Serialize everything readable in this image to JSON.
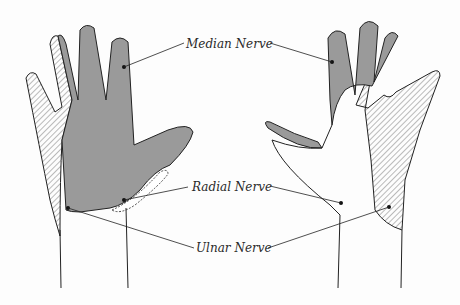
{
  "diagram": {
    "colors": {
      "median": "#9a9a9a",
      "radial": "#ffffff",
      "ulnar_hatch": "#555555",
      "outline": "#222222",
      "background": "#fdfdfd"
    },
    "labels": [
      {
        "id": "median",
        "text": "Median Nerve"
      },
      {
        "id": "radial",
        "text": "Radial Nerve"
      },
      {
        "id": "ulnar",
        "text": "Ulnar Nerve"
      }
    ],
    "hands": [
      {
        "id": "left",
        "view": "palmar"
      },
      {
        "id": "right",
        "view": "dorsal"
      }
    ]
  }
}
